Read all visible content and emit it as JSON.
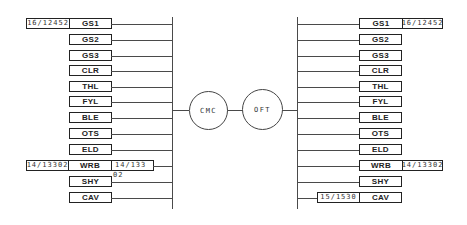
{
  "diagram": {
    "type": "network-bus-diagram",
    "center_nodes": [
      {
        "id": "cmc",
        "label": "CMC"
      },
      {
        "id": "oft",
        "label": "OFT"
      }
    ],
    "left_bus": {
      "rows": [
        {
          "label": "GS1",
          "tag_left": "16/12452"
        },
        {
          "label": "GS2"
        },
        {
          "label": "GS3"
        },
        {
          "label": "CLR"
        },
        {
          "label": "THL"
        },
        {
          "label": "FYL"
        },
        {
          "label": "BLE"
        },
        {
          "label": "OTS"
        },
        {
          "label": "ELD"
        },
        {
          "label": "WRB",
          "tag_left": "14/13302",
          "tag_right": "14/133",
          "tag_right_overflow": "02"
        },
        {
          "label": "SHY"
        },
        {
          "label": "CAV"
        }
      ]
    },
    "right_bus": {
      "rows": [
        {
          "label": "GS1",
          "tag_right": "16/12452"
        },
        {
          "label": "GS2"
        },
        {
          "label": "GS3"
        },
        {
          "label": "CLR"
        },
        {
          "label": "THL"
        },
        {
          "label": "FYL"
        },
        {
          "label": "BLE"
        },
        {
          "label": "OTS"
        },
        {
          "label": "ELD"
        },
        {
          "label": "WRB",
          "tag_right": "14/13302"
        },
        {
          "label": "SHY"
        },
        {
          "label": "CAV",
          "tag_left": "15/1530"
        }
      ]
    }
  }
}
